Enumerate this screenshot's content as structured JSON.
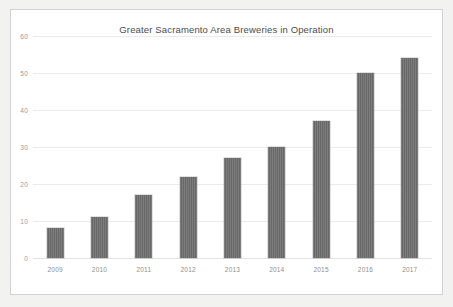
{
  "card": {
    "background_color": "#ffffff",
    "border_color": "#d2d2d2"
  },
  "page": {
    "background_color": "#f2f2f0"
  },
  "chart_data": {
    "type": "bar",
    "title": "Greater Sacramento Area Breweries in Operation",
    "xlabel": "",
    "ylabel": "",
    "categories": [
      "2009",
      "2010",
      "2011",
      "2012",
      "2013",
      "2014",
      "2015",
      "2016",
      "2017"
    ],
    "values": [
      8,
      11,
      17,
      22,
      27,
      30,
      37,
      50,
      54
    ],
    "ylim": [
      0,
      60
    ],
    "y_ticks": [
      0,
      10,
      20,
      30,
      40,
      50,
      60
    ],
    "y_tick_labels": [
      "0",
      "10",
      "20",
      "30",
      "40",
      "50",
      "60"
    ],
    "grid": true,
    "grid_axis": "y",
    "legend": false,
    "bar_color": "#6e6e6e",
    "grid_color": "#eceaea",
    "tick_label_color": "#9a9a9a",
    "title_color": "#4c4c4c"
  }
}
